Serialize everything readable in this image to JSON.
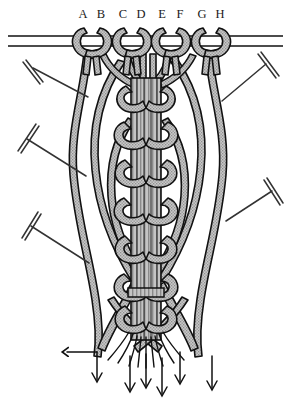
{
  "diagram": {
    "width": 291,
    "height": 408,
    "background_color": "#ffffff",
    "cord_fill_color": "#b8b8b8",
    "cord_outline_color": "#111111",
    "pin_color": "#333333",
    "arrow_color": "#111111",
    "label_color": "#1a1a1a"
  },
  "cord_labels": [
    {
      "id": "A",
      "text": "A",
      "x": 83,
      "y": 18
    },
    {
      "id": "B",
      "text": "B",
      "x": 101,
      "y": 18
    },
    {
      "id": "C",
      "text": "C",
      "x": 123,
      "y": 18
    },
    {
      "id": "D",
      "text": "D",
      "x": 141,
      "y": 18
    },
    {
      "id": "E",
      "text": "E",
      "x": 162,
      "y": 18
    },
    {
      "id": "F",
      "text": "F",
      "x": 180,
      "y": 18
    },
    {
      "id": "G",
      "text": "G",
      "x": 202,
      "y": 18
    },
    {
      "id": "H",
      "text": "H",
      "x": 220,
      "y": 18
    }
  ],
  "holding_cord": {
    "name": "horizontal-holding-cord",
    "y_top": 36,
    "y_bottom": 46,
    "x_start": 8,
    "x_end": 283
  },
  "mounting_knots": [
    {
      "id": "knot-AB",
      "center_x": 92,
      "center_y": 42,
      "cords": [
        "A",
        "B"
      ]
    },
    {
      "id": "knot-CD",
      "center_x": 132,
      "center_y": 42,
      "cords": [
        "C",
        "D"
      ]
    },
    {
      "id": "knot-EF",
      "center_x": 171,
      "center_y": 42,
      "cords": [
        "E",
        "F"
      ]
    },
    {
      "id": "knot-GH",
      "center_x": 211,
      "center_y": 42,
      "cords": [
        "G",
        "H"
      ]
    }
  ],
  "pins": [
    {
      "id": "pin-left-1",
      "head_x": 33,
      "head_y": 68,
      "tip_x": 88,
      "tip_y": 97,
      "side": "left"
    },
    {
      "id": "pin-left-2",
      "head_x": 27,
      "head_y": 139,
      "tip_x": 86,
      "tip_y": 176,
      "side": "left"
    },
    {
      "id": "pin-left-3",
      "head_x": 31,
      "head_y": 226,
      "tip_x": 89,
      "tip_y": 263,
      "side": "left"
    },
    {
      "id": "pin-right-1",
      "head_x": 266,
      "head_y": 64,
      "tip_x": 222,
      "tip_y": 101,
      "side": "right"
    },
    {
      "id": "pin-right-2",
      "head_x": 272,
      "head_y": 191,
      "tip_x": 226,
      "tip_y": 221,
      "side": "right"
    }
  ],
  "knot_column": {
    "name": "central-braided-column",
    "center_x": 146,
    "top_y": 78,
    "bottom_y": 340,
    "core_cord_count": 4,
    "wrap_knot_count": 7
  },
  "direction_arrows": [
    {
      "id": "arrow-1",
      "x": 97,
      "y_start": 352,
      "y_end": 382
    },
    {
      "id": "arrow-2",
      "x": 130,
      "y_start": 356,
      "y_end": 392
    },
    {
      "id": "arrow-3",
      "x": 146,
      "y_start": 354,
      "y_end": 388
    },
    {
      "id": "arrow-4",
      "x": 162,
      "y_start": 358,
      "y_end": 396
    },
    {
      "id": "arrow-5",
      "x": 180,
      "y_start": 352,
      "y_end": 384
    },
    {
      "id": "arrow-6",
      "x": 212,
      "y_start": 356,
      "y_end": 390
    }
  ]
}
